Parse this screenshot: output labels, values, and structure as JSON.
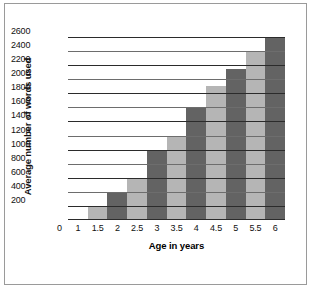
{
  "chart_data": {
    "type": "bar",
    "title": "",
    "xlabel": "Age in years",
    "ylabel": "Average number of words used",
    "categories": [
      "1.5",
      "2",
      "2.5",
      "3",
      "3.5",
      "4",
      "4.5",
      "5",
      "5.5",
      "6"
    ],
    "values": [
      200,
      400,
      600,
      1000,
      1200,
      1600,
      1900,
      2150,
      2400,
      2600
    ],
    "x_tick_labels": [
      "0",
      "1",
      "1.5",
      "2",
      "2.5",
      "3",
      "3.5",
      "4",
      "4.5",
      "5",
      "5.5",
      "6"
    ],
    "y_tick_labels": [
      "200",
      "400",
      "600",
      "800",
      "1000",
      "1200",
      "1400",
      "1600",
      "1800",
      "2000",
      "2200",
      "2400",
      "2600"
    ],
    "y_ticks": [
      200,
      400,
      600,
      800,
      1000,
      1200,
      1400,
      1600,
      1800,
      2000,
      2200,
      2400,
      2600
    ],
    "ylim": [
      0,
      2700
    ],
    "grid": true,
    "legend": "none",
    "bar_colors": [
      "#b5b5b5",
      "#636363"
    ],
    "series": [
      {
        "name": "Average number of words used",
        "values": [
          200,
          400,
          600,
          1000,
          1200,
          1600,
          1900,
          2150,
          2400,
          2600
        ]
      }
    ],
    "bars": [
      {
        "category": "1.5",
        "value": 200,
        "color": "#b5b5b5"
      },
      {
        "category": "2",
        "value": 400,
        "color": "#636363"
      },
      {
        "category": "2.5",
        "value": 600,
        "color": "#b5b5b5"
      },
      {
        "category": "3",
        "value": 1000,
        "color": "#636363"
      },
      {
        "category": "3.5",
        "value": 1200,
        "color": "#b5b5b5"
      },
      {
        "category": "4",
        "value": 1600,
        "color": "#636363"
      },
      {
        "category": "4.5",
        "value": 1900,
        "color": "#b5b5b5"
      },
      {
        "category": "5",
        "value": 2150,
        "color": "#636363"
      },
      {
        "category": "5.5",
        "value": 2400,
        "color": "#b5b5b5"
      },
      {
        "category": "6",
        "value": 2600,
        "color": "#636363"
      }
    ]
  },
  "colors": {
    "frame": "#9a9a9a",
    "gridline": "#2b2b2b",
    "background": "#ffffff",
    "text": "#111111"
  }
}
